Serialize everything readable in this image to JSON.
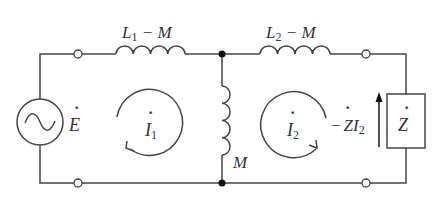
{
  "diagram": {
    "type": "circuit",
    "colors": {
      "wire": "#444444",
      "text": "#333333",
      "background": "#ffffff"
    },
    "labels": {
      "L1": {
        "main": "L",
        "sub": "1",
        "rest": " − M"
      },
      "L2": {
        "main": "L",
        "sub": "2",
        "rest": " − M"
      },
      "M": "M",
      "E": "E",
      "E_dot": "·",
      "I1": {
        "main": "I",
        "sub": "1",
        "dot": "·"
      },
      "I2": {
        "main": "I",
        "sub": "2",
        "dot": "·"
      },
      "ZI2": {
        "minus": "−",
        "Z": "Z",
        "I": "I",
        "sub": "2",
        "dot": "·"
      },
      "Z": {
        "main": "Z",
        "dot": "·"
      }
    },
    "components": [
      {
        "id": "source-E",
        "kind": "ac-voltage-source",
        "icon": "sine-wave-icon"
      },
      {
        "id": "inductor-L1-M",
        "kind": "inductor",
        "label": "L1 − M"
      },
      {
        "id": "inductor-L2-M",
        "kind": "inductor",
        "label": "L2 − M"
      },
      {
        "id": "inductor-M",
        "kind": "inductor",
        "label": "M"
      },
      {
        "id": "impedance-Z",
        "kind": "impedance-box",
        "label": "Z"
      }
    ],
    "loops": [
      {
        "id": "loop-I1",
        "direction": "counter-clockwise",
        "label": "I1"
      },
      {
        "id": "loop-I2",
        "direction": "clockwise",
        "label": "I2"
      }
    ],
    "terminals": 4,
    "nodes": 2
  }
}
